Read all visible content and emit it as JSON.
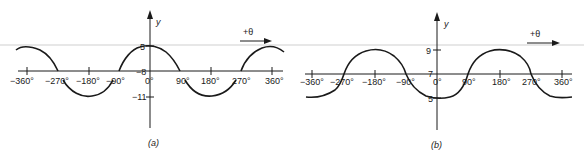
{
  "panels": [
    {
      "id": "a",
      "caption": "(a)",
      "y_axis_label": "y",
      "direction_label": "+θ",
      "equation_hint": "y = -8 + 3 cos θ",
      "x_ticks": [
        "−360°",
        "−270°",
        "−180°",
        "−90°",
        "0°",
        "90°",
        "180°",
        "270°",
        "360°"
      ],
      "y_ticks": [
        {
          "label": "5",
          "value": -5
        },
        {
          "label": "−8",
          "value": -8
        },
        {
          "label": "−11",
          "value": -11
        }
      ]
    },
    {
      "id": "b",
      "caption": "(b)",
      "y_axis_label": "y",
      "direction_label": "+θ",
      "equation_hint": "y = 7 − 2 cos θ",
      "x_ticks": [
        "−360°",
        "−270°",
        "−180°",
        "−90°",
        "0°",
        "90°",
        "180°",
        "270°",
        "360°"
      ],
      "y_ticks": [
        {
          "label": "9",
          "value": 9
        },
        {
          "label": "7",
          "value": 7
        },
        {
          "label": "5",
          "value": 5
        }
      ]
    }
  ],
  "colors": {
    "ink": "#1a1a1a",
    "scan_line": "#c8c8c8"
  }
}
